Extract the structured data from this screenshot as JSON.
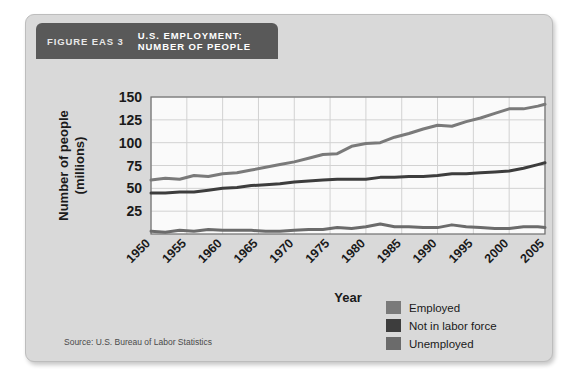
{
  "figure": {
    "label": "FIGURE EAS 3",
    "title_line1": "U.S. EMPLOYMENT:",
    "title_line2": "NUMBER OF PEOPLE",
    "source": "Source: U.S. Bureau of Labor Statistics"
  },
  "colors": {
    "card_background": "#d9d9d9",
    "title_bar": "#595959",
    "plot_background": "#fafafa",
    "gridline": "#d2d2d2",
    "axis": "#6e6e6e",
    "employed": "#7a7a7a",
    "not_in_labor_force": "#3d3d3d",
    "unemployed": "#6b6b6b",
    "text": "#1a1a1a"
  },
  "legend": {
    "position": "bottom-right",
    "items": [
      {
        "label": "Employed",
        "color": "#7a7a7a"
      },
      {
        "label": "Not in labor force",
        "color": "#3d3d3d"
      },
      {
        "label": "Unemployed",
        "color": "#6b6b6b"
      }
    ]
  },
  "chart_data": {
    "type": "line",
    "title": "U.S. EMPLOYMENT: NUMBER OF PEOPLE",
    "xlabel": "Year",
    "ylabel": "Number of people (millions)",
    "xlim": [
      1950,
      2005
    ],
    "ylim": [
      0,
      150
    ],
    "xticks": [
      1950,
      1955,
      1960,
      1965,
      1970,
      1975,
      1980,
      1985,
      1990,
      1995,
      2000,
      2005
    ],
    "xtick_labels": [
      "1950",
      "1955",
      "1960",
      "1965",
      "1970",
      "1975",
      "1980",
      "1985",
      "1990",
      "1995",
      "2000",
      "2005"
    ],
    "yticks": [
      25,
      50,
      75,
      100,
      125,
      150
    ],
    "ytick_labels": [
      "25",
      "50",
      "75",
      "100",
      "125",
      "150"
    ],
    "grid": true,
    "legend_position": "outside bottom-right",
    "x": [
      1950,
      1952,
      1954,
      1956,
      1958,
      1960,
      1962,
      1964,
      1966,
      1968,
      1970,
      1972,
      1974,
      1976,
      1978,
      1980,
      1982,
      1984,
      1986,
      1988,
      1990,
      1992,
      1994,
      1996,
      1998,
      2000,
      2002,
      2004,
      2005
    ],
    "series": [
      {
        "name": "Employed",
        "color": "#7a7a7a",
        "values": [
          59,
          61,
          60,
          64,
          63,
          66,
          67,
          70,
          73,
          76,
          79,
          83,
          87,
          88,
          96,
          99,
          100,
          106,
          110,
          115,
          119,
          118,
          123,
          127,
          132,
          137,
          137,
          140,
          142
        ]
      },
      {
        "name": "Not in labor force",
        "color": "#3d3d3d",
        "values": [
          45,
          45,
          46,
          46,
          48,
          50,
          51,
          53,
          54,
          55,
          57,
          58,
          59,
          60,
          60,
          60,
          62,
          62,
          63,
          63,
          64,
          66,
          66,
          67,
          68,
          69,
          72,
          76,
          78
        ]
      },
      {
        "name": "Unemployed",
        "color": "#6b6b6b",
        "values": [
          3,
          2,
          4,
          3,
          5,
          4,
          4,
          4,
          3,
          3,
          4,
          5,
          5,
          7,
          6,
          8,
          11,
          8,
          8,
          7,
          7,
          10,
          8,
          7,
          6,
          6,
          8,
          8,
          7
        ]
      }
    ]
  }
}
